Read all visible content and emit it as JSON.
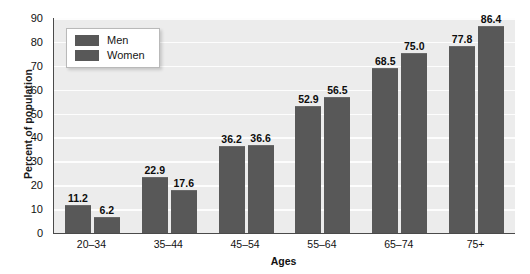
{
  "chart_data": {
    "type": "bar",
    "title": "",
    "xlabel": "Ages",
    "ylabel": "Percent of population",
    "categories": [
      "20–34",
      "35–44",
      "45–54",
      "55–64",
      "65–74",
      "75+"
    ],
    "series": [
      {
        "name": "Men",
        "values": [
          11.2,
          22.9,
          36.2,
          52.9,
          68.5,
          77.8
        ]
      },
      {
        "name": "Women",
        "values": [
          6.2,
          17.6,
          36.6,
          56.5,
          75.0,
          86.4
        ]
      }
    ],
    "ylim": [
      0,
      90
    ],
    "yticks": [
      0,
      10,
      20,
      30,
      40,
      50,
      60,
      70,
      80,
      90
    ],
    "ytick_labels": [
      "0",
      "10",
      "20",
      "30",
      "40",
      "50",
      "60",
      "70",
      "80",
      "90"
    ],
    "grid": true,
    "legend_position": "top-left",
    "colors": {
      "men_bar": "#585858",
      "women_bar": "#585858",
      "plot_background": "#ececec",
      "gridline": "#fdfdfd",
      "axis": "#4a4a4a",
      "page_background": "#ffffff",
      "text": "#111111"
    },
    "data_labels": [
      "11.2",
      "6.2",
      "22.9",
      "17.6",
      "36.2",
      "36.6",
      "52.9",
      "56.5",
      "68.5",
      "75.0",
      "77.8",
      "86.4"
    ]
  },
  "legend": {
    "items": [
      {
        "label": "Men"
      },
      {
        "label": "Women"
      }
    ]
  }
}
